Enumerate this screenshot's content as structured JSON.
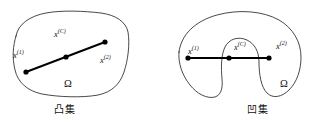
{
  "figure": {
    "background_color": "#ffffff",
    "outline_color": "#1a1a1a",
    "segment_color": "#000000"
  },
  "panels": [
    {
      "id": "convex",
      "caption": "凸集",
      "region_label": "Ω",
      "points": [
        {
          "key": "x1",
          "base": "x",
          "superscript": "(1)"
        },
        {
          "key": "xc",
          "base": "x",
          "superscript": "(C)"
        },
        {
          "key": "x2",
          "base": "x",
          "superscript": "(2)"
        }
      ]
    },
    {
      "id": "concave",
      "caption": "凹集",
      "region_label": "Ω",
      "points": [
        {
          "key": "x1",
          "base": "x",
          "superscript": "(1)"
        },
        {
          "key": "xc",
          "base": "x",
          "superscript": "(C)"
        },
        {
          "key": "x2",
          "base": "x",
          "superscript": "(2)"
        }
      ]
    }
  ],
  "labels": {
    "convex": {
      "x1_base": "x",
      "x1_sup": "(1)",
      "xc_base": "x",
      "xc_sup": "(C)",
      "x2_base": "x",
      "x2_sup": "(2)",
      "omega": "Ω",
      "caption": "凸集"
    },
    "concave": {
      "x1_base": "x",
      "x1_sup": "(1)",
      "xc_base": "x",
      "xc_sup": "(C)",
      "x2_base": "x",
      "x2_sup": "(2)",
      "omega": "Ω",
      "caption": "凹集"
    }
  }
}
